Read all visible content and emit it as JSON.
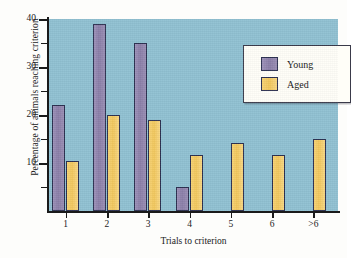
{
  "chart_data": {
    "type": "bar",
    "title": "",
    "xlabel": "Trials to criterion",
    "ylabel": "Percentage of animals reaching criterion",
    "categories": [
      "1",
      "2",
      "3",
      "4",
      "5",
      "6",
      ">6"
    ],
    "series": [
      {
        "name": "Young",
        "color": "#8a7ea8",
        "values": [
          22,
          39,
          35,
          5,
          0,
          0,
          0
        ]
      },
      {
        "name": "Aged",
        "color": "#f2c75c",
        "values": [
          10.5,
          20,
          19,
          11.7,
          14.2,
          11.7,
          15
        ]
      }
    ],
    "ylim": [
      0,
      40
    ],
    "ytick_labels": [
      "10",
      "20",
      "30",
      "40"
    ],
    "ytick_values": [
      10,
      20,
      30,
      40
    ],
    "yminor_values": [
      5,
      15,
      25,
      35
    ],
    "grid": false,
    "legend_position": "top-right",
    "plot_background": "#90c1d2"
  },
  "legend": {
    "entries": [
      {
        "label": "Young"
      },
      {
        "label": "Aged"
      }
    ]
  },
  "axes": {
    "y_title": "Percentage of animals reaching criterion",
    "x_title": "Trials to criterion"
  }
}
